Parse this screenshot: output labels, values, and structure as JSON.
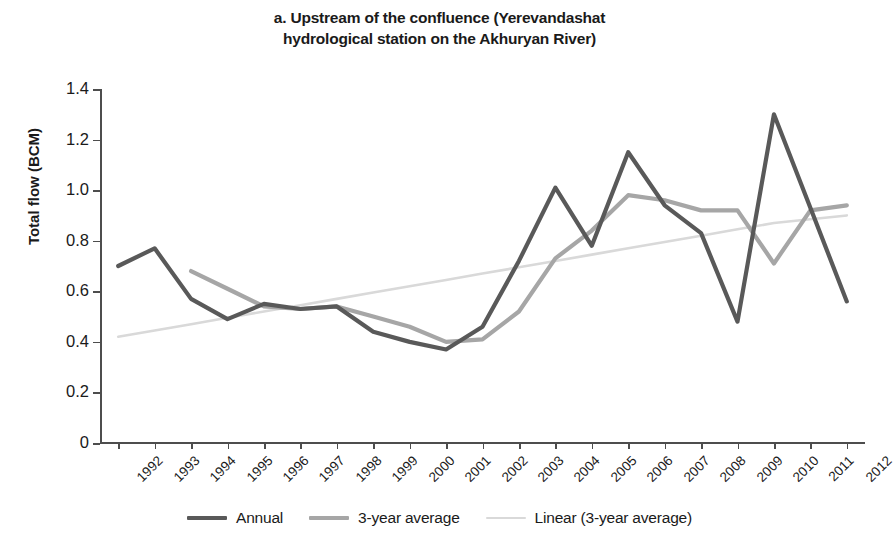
{
  "title": {
    "line1": "a. Upstream of the confluence (Yerevandashat",
    "line2": "hydrological station on the Akhuryan River)"
  },
  "axes": {
    "y_title": "Total flow (BCM)",
    "y_ticks": [
      "1.4",
      "1.2",
      "1.0",
      "0.8",
      "0.6",
      "0.4",
      "0.2",
      "0"
    ],
    "x_title": ""
  },
  "legend": {
    "items": [
      {
        "label": "Annual",
        "color": "#595959",
        "style": "thick"
      },
      {
        "label": "3-year average",
        "color": "#a6a6a6",
        "style": "thick"
      },
      {
        "label": "Linear (3-year average)",
        "color": "#d9d9d9",
        "style": "thin"
      }
    ]
  },
  "chart_data": {
    "type": "line",
    "title": "a. Upstream of the confluence (Yerevandashat hydrological station on the Akhuryan River)",
    "xlabel": "",
    "ylabel": "Total flow (BCM)",
    "ylim": [
      0,
      1.4
    ],
    "ytick_values": [
      0,
      0.2,
      0.4,
      0.6,
      0.8,
      1.0,
      1.2,
      1.4
    ],
    "grid": false,
    "legend_position": "bottom",
    "x": [
      "1992",
      "1993",
      "1994",
      "1995",
      "1996",
      "1997",
      "1998",
      "1999",
      "2000",
      "2001",
      "2002",
      "2003",
      "2004",
      "2005",
      "2006",
      "2007",
      "2008",
      "2009",
      "2010",
      "2011",
      "2012"
    ],
    "series": [
      {
        "name": "Annual",
        "color": "#595959",
        "values": [
          0.7,
          0.77,
          0.57,
          0.49,
          0.55,
          0.53,
          0.54,
          0.44,
          0.4,
          0.37,
          0.46,
          0.72,
          1.01,
          0.78,
          1.15,
          0.94,
          0.83,
          0.48,
          1.3,
          0.93,
          0.56
        ]
      },
      {
        "name": "3-year average",
        "color": "#a6a6a6",
        "values": [
          null,
          null,
          0.68,
          0.61,
          0.54,
          0.53,
          0.54,
          0.5,
          0.46,
          0.4,
          0.41,
          0.52,
          0.73,
          0.84,
          0.98,
          0.96,
          0.92,
          0.92,
          0.71,
          0.92,
          0.94
        ]
      },
      {
        "name": "Linear (3-year average)",
        "color": "#d9d9d9",
        "values": [
          0.42,
          0.445,
          0.47,
          0.495,
          0.52,
          0.545,
          0.57,
          0.595,
          0.62,
          0.645,
          0.67,
          0.695,
          0.72,
          0.745,
          0.77,
          0.795,
          0.82,
          0.845,
          0.87,
          0.885,
          0.9
        ]
      }
    ]
  }
}
